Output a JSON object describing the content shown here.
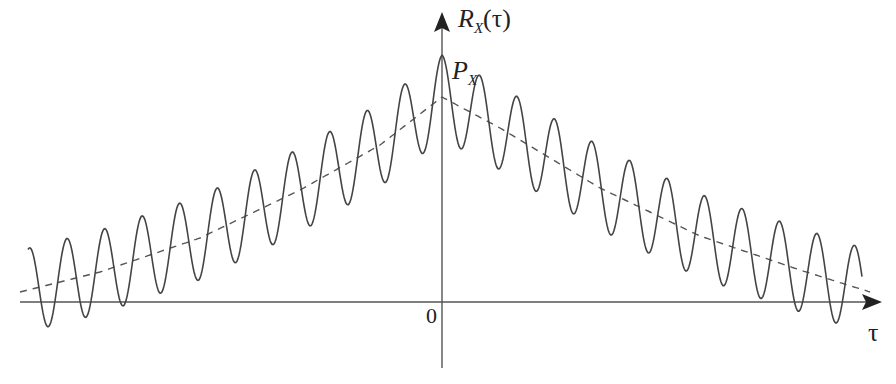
{
  "figure": {
    "title": "",
    "y_axis_label": {
      "main": "R",
      "sub": "X",
      "arg": "(τ)"
    },
    "peak_label": {
      "main": "P",
      "sub": "X"
    },
    "origin_label": "0",
    "x_axis_label": "τ"
  },
  "chart_data": {
    "type": "line",
    "title": "",
    "xlabel": "τ",
    "ylabel": "R_X(τ)",
    "annotations": [
      {
        "text": "P_X",
        "position": "value of R_X at τ = 0 (peak)"
      },
      {
        "text": "0",
        "position": "origin"
      }
    ],
    "series": [
      {
        "name": "R_X(τ)",
        "style": "solid",
        "description": "Oscillating autocorrelation: decaying envelope plus constant-amplitude cosine, symmetric about τ = 0",
        "peaks_px": [
          [
            66,
            246
          ],
          [
            107,
            238
          ],
          [
            144,
            222
          ],
          [
            180,
            196
          ],
          [
            217,
            178
          ],
          [
            252,
            160
          ],
          [
            289,
            140
          ],
          [
            323,
            123
          ],
          [
            362,
            104
          ],
          [
            399,
            82
          ],
          [
            442,
            56
          ],
          [
            486,
            86
          ],
          [
            523,
            108
          ],
          [
            561,
            132
          ],
          [
            598,
            142
          ],
          [
            633,
            162
          ],
          [
            670,
            180
          ],
          [
            706,
            198
          ],
          [
            743,
            223
          ],
          [
            780,
            239
          ],
          [
            816,
            248
          ],
          [
            856,
            255
          ]
        ],
        "troughs_px": [
          [
            46,
            338
          ],
          [
            87,
            328
          ],
          [
            123,
            314
          ],
          [
            160,
            297
          ],
          [
            727,
            300
          ],
          [
            763,
            313
          ],
          [
            799,
            328
          ],
          [
            838,
            337
          ]
        ]
      },
      {
        "name": "envelope",
        "style": "dashed",
        "description": "Decaying envelope, maximum at τ = 0 below P_X, approaching the τ axis at both ends",
        "points_px": [
          [
            20,
            292
          ],
          [
            100,
            272
          ],
          [
            200,
            238
          ],
          [
            300,
            190
          ],
          [
            380,
            145
          ],
          [
            442,
            97
          ],
          [
            500,
            128
          ],
          [
            600,
            188
          ],
          [
            700,
            236
          ],
          [
            800,
            270
          ],
          [
            870,
            292
          ]
        ]
      }
    ],
    "axes": {
      "origin_px": [
        442,
        302
      ],
      "x_axis_px": [
        20,
        880
      ],
      "y_axis_px": [
        368,
        13
      ],
      "oscillation_period_px": 37.5,
      "oscillation_amplitude_px": 44
    },
    "grid": false,
    "legend": "none"
  },
  "colors": {
    "curve": "#444444",
    "axis": "#555555",
    "text": "#222222",
    "background": "#ffffff"
  }
}
